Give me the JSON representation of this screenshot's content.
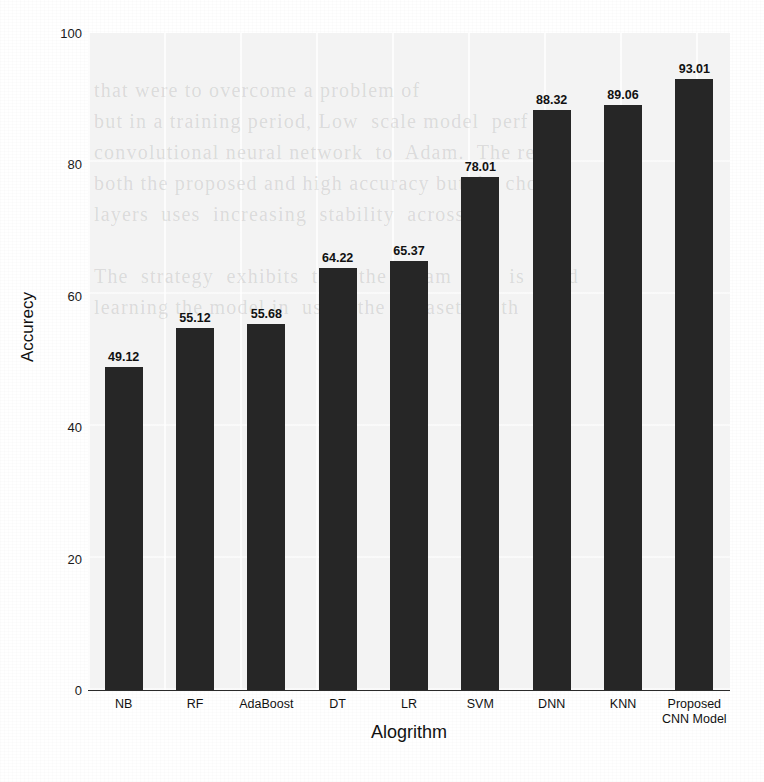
{
  "chart_data": {
    "type": "bar",
    "title": "",
    "xlabel": "Alogrithm",
    "ylabel": "Accurecy",
    "categories": [
      "NB",
      "RF",
      "AdaBoost",
      "DT",
      "LR",
      "SVM",
      "DNN",
      "KNN",
      "Proposed CNN Model"
    ],
    "category_lines": [
      [
        "NB"
      ],
      [
        "RF"
      ],
      [
        "AdaBoost"
      ],
      [
        "DT"
      ],
      [
        "LR"
      ],
      [
        "SVM"
      ],
      [
        "DNN"
      ],
      [
        "KNN"
      ],
      [
        "Proposed",
        "CNN Model"
      ]
    ],
    "values": [
      49.12,
      55.12,
      55.68,
      64.22,
      65.37,
      78.01,
      88.32,
      89.06,
      93.01
    ],
    "value_labels": [
      "49.12",
      "55.12",
      "55.68",
      "64.22",
      "65.37",
      "78.01",
      "88.32",
      "89.06",
      "93.01"
    ],
    "ylim": [
      0,
      100
    ],
    "yticks": [
      0,
      20,
      40,
      60,
      80,
      100
    ],
    "ytick_labels": [
      "0",
      "20",
      "40",
      "60",
      "80",
      "100"
    ],
    "xlim_note": "9 categorical bars",
    "grid": "faint vertical and horizontal gridlines",
    "legend": "none",
    "bar_color": "#262626",
    "plot_background": "#f3f3f3",
    "figure_background": "#ffffff"
  },
  "background_bleed": {
    "text": "that were to overcome a problem of\nbut in a training period, Low  scale model  perf\nconvolutional neural network  to  Adam.  The res\nboth the proposed and high accuracy but the cho\nlayers  uses  increasing  stability  across\n\nThe  strategy  exhibits  that  the  Adam  test  is  used\nlearning the model in  using the  dataset for th"
  }
}
